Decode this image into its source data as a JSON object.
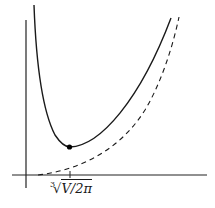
{
  "figure": {
    "type": "function-plot",
    "x_tick_label": "∛V/2π",
    "x_tick_label_parts": {
      "root_index": "3",
      "radicand": "V/2π"
    },
    "curves": [
      {
        "name": "total-surface-curve",
        "style": "solid",
        "color": "#1a1a1a"
      },
      {
        "name": "asymptote-curve",
        "style": "dashed",
        "color": "#1a1a1a"
      }
    ],
    "minimum_point": {
      "marked": true,
      "color": "#000000"
    },
    "colors": {
      "axes": "#222222",
      "background": "#ffffff"
    }
  }
}
